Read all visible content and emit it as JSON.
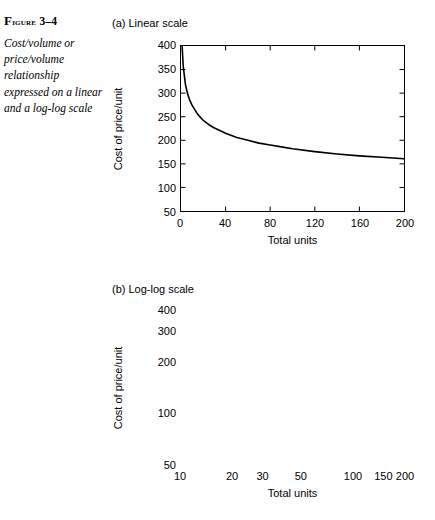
{
  "figure": {
    "label_prefix": "F",
    "label_word": "igure",
    "label_number": "3–4",
    "label_full": "FIGURE 3–4",
    "caption": "Cost/volume or price/volume relationship expressed on a linear and a log-log scale"
  },
  "chart_data": [
    {
      "type": "line",
      "title": "(a) Linear scale",
      "xlabel": "Total units",
      "ylabel": "Cost of price/unit",
      "xscale": "linear",
      "yscale": "linear",
      "xlim": [
        0,
        200
      ],
      "ylim": [
        50,
        400
      ],
      "xticks": [
        0,
        40,
        80,
        120,
        160,
        200
      ],
      "xticklabels": [
        "0",
        "40",
        "80",
        "120",
        "160",
        "200"
      ],
      "yticks": [
        50,
        100,
        150,
        200,
        250,
        300,
        350,
        400
      ],
      "yticklabels": [
        "50",
        "100",
        "150",
        "200",
        "250",
        "300",
        "350",
        "400"
      ],
      "grid": false,
      "legend": "none",
      "series": [
        {
          "name": "Cost per unit",
          "x": [
            1,
            2,
            4,
            6,
            8,
            10,
            15,
            20,
            25,
            30,
            40,
            50,
            60,
            70,
            80,
            90,
            100,
            120,
            140,
            160,
            180,
            200
          ],
          "y": [
            400,
            357,
            318,
            298,
            284,
            274,
            255,
            242,
            233,
            226,
            215,
            206,
            200,
            194,
            190,
            186,
            182,
            176,
            171,
            167,
            164,
            161
          ]
        }
      ]
    },
    {
      "type": "line",
      "title": "(b) Log-log scale",
      "xlabel": "Total units",
      "ylabel": "Cost of price/unit",
      "xscale": "log",
      "yscale": "log",
      "xlim": [
        10,
        200
      ],
      "ylim": [
        50,
        400
      ],
      "xticks": [
        10,
        20,
        30,
        50,
        100,
        150,
        200
      ],
      "xticklabels": [
        "10",
        "20",
        "30",
        "50",
        "100",
        "150",
        "200"
      ],
      "yticks": [
        50,
        100,
        200,
        300,
        400
      ],
      "yticklabels": [
        "50",
        "100",
        "200",
        "300",
        "400"
      ],
      "grid": false,
      "legend": "none",
      "series": [
        {
          "name": "Cost per unit",
          "x": [
            10,
            200
          ],
          "y": [
            400,
            75
          ]
        }
      ]
    }
  ]
}
